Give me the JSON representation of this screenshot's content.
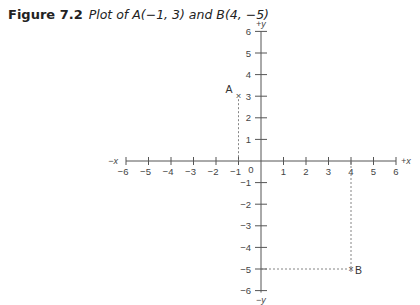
{
  "caption": {
    "figure_label": "Figure 7.2",
    "description": "Plot of A(−1, 3) and B(4, −5)"
  },
  "axes": {
    "x_neg_label": "−x",
    "x_pos_label": "+x",
    "y_pos_label": "+y",
    "y_neg_label": "−y",
    "origin_label": "0"
  },
  "chart_data": {
    "type": "scatter",
    "xlabel": "x",
    "ylabel": "y",
    "xlim": [
      -6,
      6
    ],
    "ylim": [
      -6,
      6
    ],
    "x_ticks": [
      -6,
      -5,
      -4,
      -3,
      -2,
      -1,
      1,
      2,
      3,
      4,
      5,
      6
    ],
    "y_ticks": [
      -6,
      -5,
      -4,
      -3,
      -2,
      -1,
      1,
      2,
      3,
      4,
      5,
      6
    ],
    "grid": false,
    "points": [
      {
        "label": "A",
        "x": -1,
        "y": 3
      },
      {
        "label": "B",
        "x": 4,
        "y": -5
      }
    ],
    "annotations": [
      "dashed projection lines from A to x-axis",
      "dashed projection lines from B to both axes"
    ]
  }
}
